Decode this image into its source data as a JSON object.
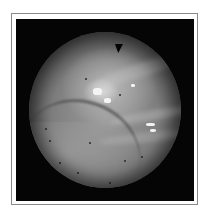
{
  "image": {
    "description": "Grayscale circular endoscopic view inside a thin bordered frame",
    "colors": {
      "frame_border": "#8a8a8a",
      "background": "#050505",
      "tissue_mid": "#8e8e8e",
      "highlight": "#f4f4f4"
    }
  }
}
